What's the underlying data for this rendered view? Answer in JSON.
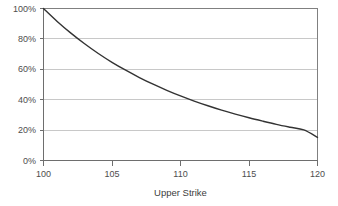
{
  "chart_data": {
    "type": "line",
    "title": "",
    "xlabel": "Upper Strike",
    "ylabel": "",
    "xlim": [
      100,
      120
    ],
    "ylim": [
      0,
      1.0
    ],
    "grid": "horizontal",
    "legend": "none",
    "x_ticks": [
      100,
      105,
      110,
      115,
      120
    ],
    "x_tick_labels": [
      "100",
      "105",
      "110",
      "115",
      "120"
    ],
    "y_ticks": [
      0,
      0.2,
      0.4,
      0.6,
      0.8,
      1.0
    ],
    "y_tick_labels": [
      "0%",
      "20%",
      "40%",
      "60%",
      "80%",
      "100%"
    ],
    "series": [
      {
        "name": "value",
        "color": "#333333",
        "x": [
          100,
          101,
          102,
          103,
          104,
          105,
          106,
          107,
          108,
          109,
          110,
          111,
          112,
          113,
          114,
          115,
          116,
          117,
          118,
          119,
          120
        ],
        "values": [
          1.0,
          0.915,
          0.838,
          0.768,
          0.704,
          0.646,
          0.594,
          0.546,
          0.502,
          0.462,
          0.425,
          0.391,
          0.36,
          0.331,
          0.305,
          0.281,
          0.259,
          0.238,
          0.219,
          0.201,
          0.152
        ]
      }
    ]
  },
  "axis": {
    "x_title": "Upper Strike",
    "x_labels": [
      "100",
      "105",
      "110",
      "115",
      "120"
    ],
    "y_labels": [
      "100%",
      "80%",
      "60%",
      "40%",
      "20%",
      "0%"
    ]
  },
  "colors": {
    "series": "#333333",
    "gridline": "#c8c8c8",
    "border": "#808080",
    "text": "#4d4d4d",
    "background": "#ffffff"
  }
}
